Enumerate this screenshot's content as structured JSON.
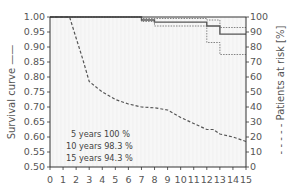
{
  "chart_data": {
    "type": "line",
    "title": "",
    "xlabel": "",
    "ylabel": "Survival curve",
    "y2label": "Patients at risk [%]",
    "xlim": [
      0,
      15
    ],
    "ylim": [
      0.5,
      1.0
    ],
    "y2lim": [
      0,
      100
    ],
    "x_ticks": [
      0,
      1,
      2,
      3,
      4,
      5,
      6,
      7,
      8,
      9,
      10,
      11,
      12,
      13,
      14,
      15
    ],
    "y_ticks": [
      "0.50",
      "0.55",
      "0.60",
      "0.65",
      "0.70",
      "0.75",
      "0.80",
      "0.85",
      "0.90",
      "0.95",
      "1.00"
    ],
    "y2_ticks": [
      "0",
      "10",
      "20",
      "30",
      "40",
      "50",
      "60",
      "70",
      "80",
      "90",
      "100"
    ],
    "grid": false,
    "legend": [
      {
        "label": "Survival curve",
        "style": "solid",
        "axis": "left"
      },
      {
        "label": "Patients at risk [%]",
        "style": "dashed",
        "axis": "right"
      }
    ],
    "series": [
      {
        "name": "Survival curve",
        "axis": "left",
        "style": "step-solid",
        "x": [
          0,
          7,
          7,
          8,
          8,
          12,
          12,
          13,
          13,
          15
        ],
        "y": [
          1.0,
          1.0,
          0.99,
          0.99,
          0.983,
          0.983,
          0.97,
          0.97,
          0.943,
          0.943
        ]
      },
      {
        "name": "Upper confidence limit",
        "axis": "left",
        "style": "step-dotted",
        "x": [
          0,
          7,
          7,
          12,
          12,
          13,
          13,
          15
        ],
        "y": [
          1.0,
          1.0,
          0.995,
          0.995,
          0.99,
          0.99,
          0.965,
          0.965
        ]
      },
      {
        "name": "Lower confidence limit",
        "axis": "left",
        "style": "step-dotted",
        "x": [
          0,
          7,
          7,
          8,
          8,
          12,
          12,
          13,
          13,
          15
        ],
        "y": [
          1.0,
          1.0,
          0.985,
          0.985,
          0.97,
          0.97,
          0.915,
          0.915,
          0.875,
          0.875
        ]
      },
      {
        "name": "Patients at risk [%]",
        "axis": "right",
        "style": "dashed",
        "x": [
          0,
          1.5,
          2,
          2.5,
          3,
          4,
          5,
          6,
          7,
          8,
          9,
          10,
          11,
          12,
          12.5,
          13,
          14,
          15
        ],
        "y": [
          100,
          100,
          86,
          72,
          57,
          50,
          45,
          42,
          40,
          39.5,
          38,
          33,
          29,
          25,
          25,
          22,
          20,
          17
        ]
      }
    ],
    "annotations": [
      "5 years 100 %",
      "10 years 98.3 %",
      "15 years 94.3 %"
    ]
  },
  "labels": {
    "left_axis_title": "Survival curve ——",
    "right_axis_title": "- - - - - Patients at risk [%]"
  },
  "colors": {
    "survival": "#555555",
    "confidence": "#666666",
    "at_risk": "#555555",
    "plot_bg": "#f7f7f7",
    "axis": "#333333"
  }
}
